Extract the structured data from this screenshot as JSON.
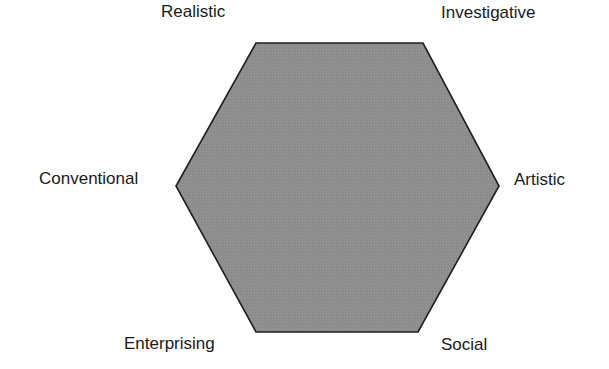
{
  "diagram": {
    "type": "hexagon",
    "title": "",
    "fill_color": "#8e8e8e",
    "stroke_color": "#1e1e1e",
    "vertices": [
      {
        "id": "realistic",
        "label": "Realistic",
        "x": 256,
        "y": 43
      },
      {
        "id": "investigative",
        "label": "Investigative",
        "x": 423,
        "y": 43
      },
      {
        "id": "artistic",
        "label": "Artistic",
        "x": 499,
        "y": 186
      },
      {
        "id": "social",
        "label": "Social",
        "x": 418,
        "y": 332
      },
      {
        "id": "enterprising",
        "label": "Enterprising",
        "x": 256,
        "y": 332
      },
      {
        "id": "conventional",
        "label": "Conventional",
        "x": 176,
        "y": 186
      }
    ]
  },
  "labels": {
    "realistic": "Realistic",
    "investigative": "Investigative",
    "artistic": "Artistic",
    "social": "Social",
    "enterprising": "Enterprising",
    "conventional": "Conventional"
  }
}
